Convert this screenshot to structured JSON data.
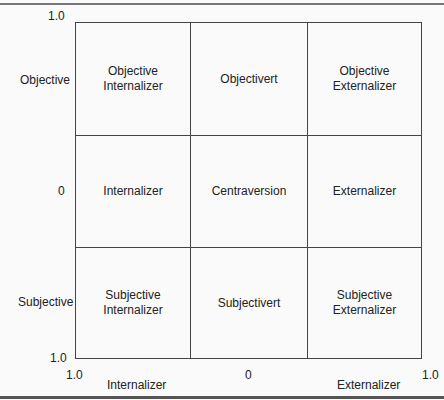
{
  "diagram": {
    "y_axis": {
      "top_tick": "1.0",
      "bottom_tick": "1.0",
      "labels": [
        "Objective",
        "0",
        "Subjective"
      ]
    },
    "x_axis": {
      "left_tick": "1.0",
      "center_tick": "0",
      "right_tick": "1.0",
      "left_label": "Internalizer",
      "right_label": "Externalizer"
    },
    "cells": [
      {
        "line1": "Objective",
        "line2": "Internalizer"
      },
      {
        "line1": "Objectivert",
        "line2": ""
      },
      {
        "line1": "Objective",
        "line2": "Externalizer"
      },
      {
        "line1": "Internalizer",
        "line2": ""
      },
      {
        "line1": "Centraversion",
        "line2": ""
      },
      {
        "line1": "Externalizer",
        "line2": ""
      },
      {
        "line1": "Subjective",
        "line2": "Internalizer"
      },
      {
        "line1": "Subjectivert",
        "line2": ""
      },
      {
        "line1": "Subjective",
        "line2": "Externalizer"
      }
    ]
  }
}
